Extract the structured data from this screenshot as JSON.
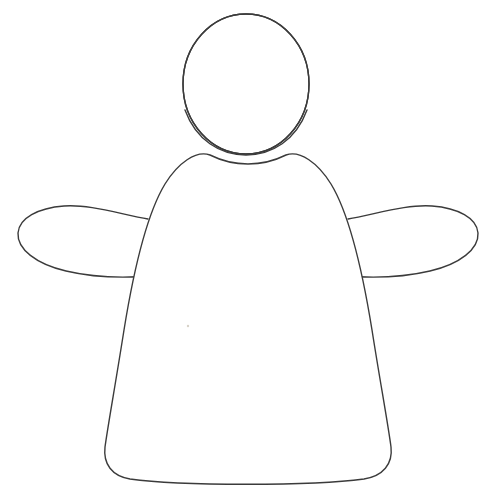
{
  "document": {
    "type": "line-art-drawing",
    "title": "Outline figure with head, body and two outstretched arms",
    "background_color": "#ffffff",
    "stroke_color": "#3b3b3b",
    "fill_color": "#ffffff",
    "stroke_width": 1.4,
    "canvas": {
      "width": 496,
      "height": 491
    }
  },
  "drawing": {
    "name": "paper-doll-figure",
    "parts": [
      {
        "name": "head",
        "shape": "ellipse",
        "cx": 246,
        "cy": 84,
        "rx": 63,
        "ry": 70
      },
      {
        "name": "body",
        "shape": "dome-skirt",
        "top_y": 152,
        "bottom_y": 479,
        "left_x": 103,
        "right_x": 392,
        "path": "M 210 155 C 196 150 178 163 165 184 C 148 212 134 268 124 330 C 116 381 108 425 105 447 C 103 464 112 476 130 479 C 180 486 312 486 364 479 C 383 476 393 464 391 447 C 388 424 380 381 372 330 C 362 268 348 212 331 184 C 318 163 300 150 286 155 C 274 161 260 164 248 164 C 236 164 222 161 210 155 Z"
      },
      {
        "name": "left-arm",
        "shape": "elongated-oval",
        "tip_x": 18,
        "tip_y": 233,
        "attach_x": 148,
        "attach_top_y": 219,
        "attach_bottom_y": 276,
        "path": "M 148 219 C 120 214 88 204 64 206 C 38 208 19 218 18 233 C 17 249 36 264 66 271 C 96 278 126 278 150 276"
      },
      {
        "name": "right-arm",
        "shape": "elongated-oval",
        "tip_x": 478,
        "tip_y": 233,
        "attach_x": 348,
        "attach_top_y": 219,
        "attach_bottom_y": 276,
        "path": "M 348 219 C 376 214 408 204 432 206 C 458 208 477 218 478 233 C 479 249 460 264 430 271 C 400 278 370 278 346 276"
      },
      {
        "name": "paper-speck",
        "shape": "dot",
        "cx": 188,
        "cy": 326,
        "r": 1.2,
        "color": "#d8d2c8"
      }
    ]
  }
}
